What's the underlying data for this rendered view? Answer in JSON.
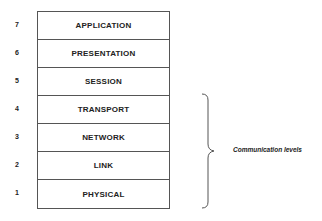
{
  "diagram": {
    "layers": [
      {
        "number": "7",
        "name": "APPLICATION"
      },
      {
        "number": "6",
        "name": "PRESENTATION"
      },
      {
        "number": "5",
        "name": "SESSION"
      },
      {
        "number": "4",
        "name": "TRANSPORT"
      },
      {
        "number": "3",
        "name": "NETWORK"
      },
      {
        "number": "2",
        "name": "LINK"
      },
      {
        "number": "1",
        "name": "PHYSICAL"
      }
    ],
    "brace_label": "Communication levels",
    "colors": {
      "line": "#555555",
      "text": "#222222",
      "background": "#ffffff"
    }
  }
}
